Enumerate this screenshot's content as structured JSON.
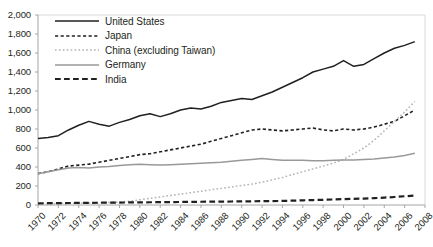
{
  "chart_data": {
    "type": "line",
    "title": "",
    "xlabel": "",
    "ylabel": "",
    "grid": false,
    "legend_position": "top-left",
    "xlim": [
      1970,
      2008
    ],
    "ylim": [
      0,
      2000
    ],
    "ytick_labels": [
      "2,000",
      "1,800",
      "1,600",
      "1,400",
      "1,200",
      "1,000",
      "800",
      "600",
      "400",
      "200",
      "0"
    ],
    "yticks": [
      2000,
      1800,
      1600,
      1400,
      1200,
      1000,
      800,
      600,
      400,
      200,
      0
    ],
    "xtick_labels": [
      "1970",
      "1972",
      "1974",
      "1976",
      "1978",
      "1980",
      "1982",
      "1984",
      "1986",
      "1988",
      "1990",
      "1992",
      "1994",
      "1996",
      "1998",
      "2000",
      "2002",
      "2004",
      "2006",
      "2008"
    ],
    "xticks": [
      1970,
      1972,
      1974,
      1976,
      1978,
      1980,
      1982,
      1984,
      1986,
      1988,
      1990,
      1992,
      1994,
      1996,
      1998,
      2000,
      2002,
      2004,
      2006,
      2008
    ],
    "x": [
      1970,
      1971,
      1972,
      1973,
      1974,
      1975,
      1976,
      1977,
      1978,
      1979,
      1980,
      1981,
      1982,
      1983,
      1984,
      1985,
      1986,
      1987,
      1988,
      1989,
      1990,
      1991,
      1992,
      1993,
      1994,
      1995,
      1996,
      1997,
      1998,
      1999,
      2000,
      2001,
      2002,
      2003,
      2004,
      2005,
      2006,
      2007
    ],
    "series": [
      {
        "name": "United States",
        "color": "#231f20",
        "style": "solid",
        "width": 1.5,
        "values": [
          700,
          710,
          730,
          790,
          840,
          880,
          850,
          830,
          870,
          900,
          940,
          960,
          930,
          960,
          1000,
          1020,
          1010,
          1040,
          1080,
          1100,
          1120,
          1110,
          1150,
          1190,
          1240,
          1290,
          1340,
          1400,
          1430,
          1460,
          1520,
          1460,
          1480,
          1540,
          1600,
          1650,
          1680,
          1720
        ]
      },
      {
        "name": "Japan",
        "color": "#231f20",
        "style": "dashed",
        "width": 1.6,
        "values": [
          330,
          350,
          380,
          410,
          420,
          430,
          450,
          470,
          490,
          510,
          530,
          540,
          560,
          580,
          600,
          620,
          640,
          670,
          700,
          730,
          760,
          790,
          800,
          790,
          780,
          790,
          800,
          810,
          790,
          780,
          800,
          790,
          800,
          820,
          850,
          880,
          940,
          1000
        ]
      },
      {
        "name": "China (excluding Taiwan)",
        "color": "#b3b3b3",
        "style": "dotted",
        "width": 1.5,
        "values": [
          10,
          12,
          14,
          16,
          18,
          20,
          22,
          26,
          30,
          40,
          55,
          70,
          85,
          100,
          115,
          130,
          145,
          160,
          175,
          190,
          205,
          220,
          240,
          265,
          290,
          320,
          350,
          380,
          410,
          440,
          480,
          540,
          600,
          680,
          780,
          880,
          980,
          1090
        ]
      },
      {
        "name": "Germany",
        "color": "#999999",
        "style": "solid",
        "width": 1.5,
        "values": [
          330,
          350,
          370,
          390,
          395,
          390,
          400,
          405,
          415,
          425,
          430,
          425,
          420,
          425,
          430,
          435,
          440,
          445,
          450,
          460,
          470,
          480,
          490,
          480,
          470,
          470,
          470,
          465,
          465,
          470,
          475,
          475,
          480,
          485,
          495,
          505,
          520,
          545
        ]
      },
      {
        "name": "India",
        "color": "#231f20",
        "style": "longdash",
        "width": 2.2,
        "values": [
          18,
          19,
          20,
          21,
          22,
          23,
          24,
          25,
          26,
          27,
          28,
          29,
          30,
          31,
          32,
          33,
          34,
          35,
          36,
          37,
          38,
          39,
          40,
          41,
          43,
          46,
          49,
          52,
          55,
          58,
          62,
          65,
          68,
          72,
          78,
          84,
          92,
          100
        ]
      }
    ]
  },
  "legend": {
    "items": [
      {
        "label": "United States"
      },
      {
        "label": "Japan"
      },
      {
        "label": "China (excluding Taiwan)"
      },
      {
        "label": "Germany"
      },
      {
        "label": "India"
      }
    ]
  }
}
